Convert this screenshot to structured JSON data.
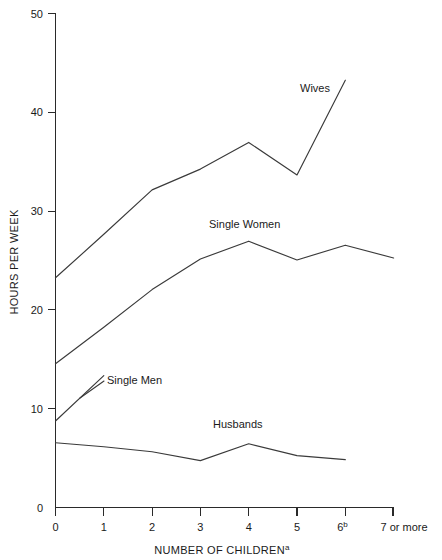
{
  "chart_data": {
    "type": "line",
    "title": "",
    "xlabel": "NUMBER OF CHILDREN",
    "xlabel_superscript": "a",
    "ylabel": "HOURS PER WEEK",
    "categories": [
      "0",
      "1",
      "2",
      "3",
      "4",
      "5",
      "6",
      "7 or more"
    ],
    "xtick_labels": [
      "0",
      "1",
      "2",
      "3",
      "4",
      "5",
      "6",
      "7 or more"
    ],
    "xtick_superscripts": [
      "",
      "",
      "",
      "",
      "",
      "",
      "b",
      ""
    ],
    "ytick_labels": [
      "0",
      "10",
      "20",
      "30",
      "40",
      "50"
    ],
    "ytick_values": [
      0,
      10,
      20,
      30,
      40,
      50
    ],
    "ylim": [
      0,
      50
    ],
    "xlim": [
      0,
      7
    ],
    "grid": false,
    "legend_position": "inline-labels",
    "line_color": "#3a3a3a",
    "series": [
      {
        "name": "Wives",
        "label": "Wives",
        "x": [
          0,
          1,
          2,
          3,
          4,
          5,
          6
        ],
        "values": [
          23.2,
          27.6,
          32.1,
          34.2,
          36.9,
          33.6,
          43.2
        ]
      },
      {
        "name": "Single Women",
        "label": "Single Women",
        "x": [
          0,
          1,
          2,
          3,
          4,
          5,
          6,
          7
        ],
        "values": [
          14.5,
          18.2,
          22.0,
          25.1,
          26.9,
          25.0,
          26.5,
          25.2
        ]
      },
      {
        "name": "Single Men",
        "label": "Single Men",
        "x": [
          0,
          1
        ],
        "values": [
          8.7,
          13.3
        ]
      },
      {
        "name": "Husbands",
        "label": "Husbands",
        "x": [
          0,
          1,
          2,
          3,
          4,
          5,
          6
        ],
        "values": [
          6.5,
          6.1,
          5.6,
          4.7,
          6.4,
          5.2,
          4.8
        ]
      }
    ],
    "annotations": [
      {
        "name": "wives-label",
        "text": "Wives",
        "x_px": 300,
        "y_px": 92
      },
      {
        "name": "single-women-label",
        "text": "Single Women",
        "x_px": 209,
        "y_px": 228
      },
      {
        "name": "single-men-label",
        "text": "Single Men",
        "x_px": 107,
        "y_px": 384
      },
      {
        "name": "husbands-label",
        "text": "Husbands",
        "x_px": 213,
        "y_px": 428
      }
    ]
  },
  "axes": {
    "y_title": "HOURS PER WEEK",
    "x_title": "NUMBER OF CHILDREN",
    "x_title_superscript": "a"
  }
}
